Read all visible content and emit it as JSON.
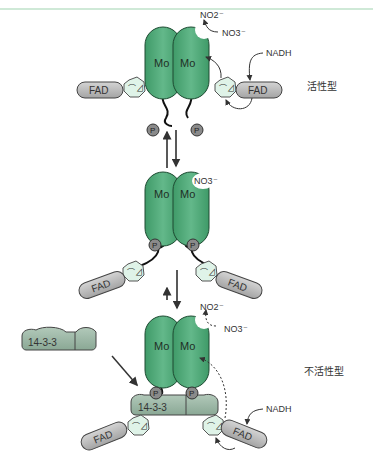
{
  "diagram": {
    "header_rule_color": "#9fd3b0",
    "colors": {
      "mo_subunit": "#4ea977",
      "mo_subunit_dark": "#3b8a60",
      "heme_domain": "#dff3e8",
      "fad_domain": "#b8b8b8",
      "phospho": "#8a8a8a",
      "protein_1433": "#9cb8a6"
    },
    "states": {
      "active": {
        "label": "活性型",
        "subunit_left": "Mo",
        "subunit_right": "Mo",
        "product": "NO2⁻",
        "substrate": "NO3⁻",
        "electron_donor": "NADH",
        "fad_left": "FAD",
        "fad_right": "FAD",
        "phospho_left": "P",
        "phospho_right": "P"
      },
      "intermediate": {
        "subunit_left": "Mo",
        "subunit_right": "Mo",
        "substrate": "NO3⁻",
        "fad_left": "FAD",
        "fad_right": "FAD",
        "phospho_left": "P",
        "phospho_right": "P"
      },
      "inactive": {
        "label": "不活性型",
        "subunit_left": "Mo",
        "subunit_right": "Mo",
        "product": "NO2⁻",
        "substrate": "NO3⁻",
        "electron_donor": "NADH",
        "fad_left": "FAD",
        "fad_right": "FAD",
        "phospho_left": "P",
        "phospho_right": "P",
        "bound_protein": "14-3-3"
      }
    },
    "free_protein": "14-3-3"
  }
}
